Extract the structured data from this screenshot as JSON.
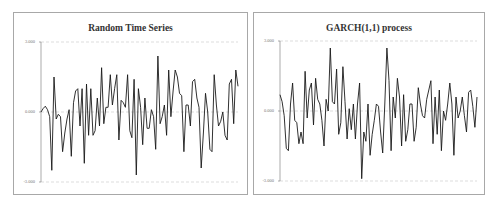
{
  "chart_data": [
    {
      "type": "line",
      "title": "Random Time Series",
      "xlabel": "",
      "ylabel": "",
      "ylim": [
        -3,
        3
      ],
      "yticks": [
        "3.000",
        "0.000",
        "-3.000"
      ],
      "grid": "horizontal dashed",
      "legend": "none",
      "series": [
        {
          "name": "Random Time Series",
          "values": [
            0.0,
            0.15,
            0.25,
            0.1,
            -0.2,
            -2.5,
            1.5,
            -0.3,
            -0.1,
            -0.2,
            -1.7,
            -0.9,
            -0.3,
            0.1,
            -1.9,
            0.4,
            0.9,
            1.0,
            -0.6,
            1.0,
            -2.2,
            1.2,
            -1.0,
            1.0,
            -1.0,
            -0.8,
            0.6,
            -0.6,
            1.9,
            -0.5,
            0.2,
            0.2,
            1.6,
            0.3,
            1.0,
            1.6,
            -1.2,
            0.5,
            0.4,
            0.2,
            1.6,
            -0.8,
            -1.1,
            1.4,
            -2.7,
            1.0,
            0.2,
            -1.4,
            0.6,
            -0.7,
            -0.7,
            0.1,
            -0.2,
            -1.6,
            2.4,
            -0.5,
            -0.2,
            0.3,
            -1.0,
            1.8,
            -0.2,
            0.9,
            1.8,
            1.5,
            0.8,
            0.7,
            -1.7,
            0.3,
            0.3,
            -0.6,
            1.3,
            1.4,
            0.6,
            0.2,
            -2.4,
            -0.9,
            0.8,
            0.0,
            -1.6,
            -1.7,
            1.6,
            0.3,
            -0.6,
            -0.4,
            0.0,
            -1.0,
            -1.2,
            1.2,
            1.4,
            -0.5,
            1.8,
            1.1
          ],
          "color": "#1a1a1a"
        }
      ]
    },
    {
      "type": "line",
      "title": "GARCH(1,1) process",
      "xlabel": "",
      "ylabel": "",
      "ylim": [
        -3,
        3
      ],
      "yticks": [
        "3.000",
        "0.000",
        "-3.000"
      ],
      "grid": "horizontal dashed",
      "legend": "none",
      "series": [
        {
          "name": "GARCH(1,1) process",
          "values": [
            0.7,
            0.4,
            -0.2,
            -1.6,
            -1.7,
            0.3,
            1.2,
            -0.4,
            -0.5,
            -1.4,
            -0.9,
            -1.4,
            1.7,
            -0.3,
            0.9,
            1.2,
            -0.6,
            1.4,
            0.5,
            0.3,
            -0.4,
            -1.5,
            0.5,
            0.0,
            2.7,
            0.4,
            0.3,
            1.8,
            -1.0,
            -0.5,
            1.9,
            0.4,
            -1.2,
            0.1,
            -0.8,
            0.3,
            -1.2,
            0.3,
            1.2,
            -2.9,
            -0.9,
            -1.3,
            0.3,
            -1.9,
            -1.0,
            -0.4,
            0.3,
            0.2,
            -0.9,
            -1.8,
            0.3,
            2.7,
            1.3,
            -1.7,
            0.6,
            -0.3,
            1.4,
            0.6,
            -1.5,
            0.7,
            -1.3,
            -0.8,
            0.3,
            0.3,
            -1.3,
            -0.7,
            1.0,
            0.3,
            -0.2,
            -0.3,
            0.5,
            0.9,
            1.3,
            -1.4,
            0.6,
            -1.0,
            0.9,
            -1.7,
            0.0,
            -0.4,
            0.3,
            1.2,
            0.3,
            -1.9,
            0.6,
            -0.3,
            0.0,
            0.6,
            -0.2,
            -0.9,
            0.8,
            0.9,
            0.2,
            -0.7,
            0.6
          ],
          "color": "#1a1a1a"
        }
      ]
    }
  ],
  "charts": [
    {
      "title": "Random Time Series",
      "yticks": {
        "top": "3.000",
        "mid": "0.000",
        "bottom": "-3.000"
      }
    },
    {
      "title": "GARCH(1,1) process",
      "yticks": {
        "top": "3.000",
        "mid": "0.000",
        "bottom": "-3.000"
      }
    }
  ]
}
